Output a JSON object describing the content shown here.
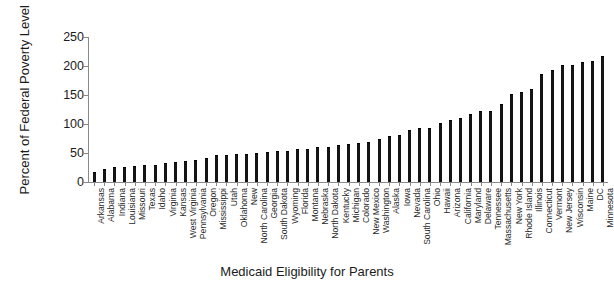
{
  "chart_data": {
    "type": "bar",
    "title": "",
    "xlabel": "Medicaid Eligibility for Parents",
    "ylabel": "Percent of Federal Poverty Level",
    "ylim": [
      0,
      250
    ],
    "yticks": [
      0,
      50,
      100,
      150,
      200,
      250
    ],
    "grid": false,
    "legend": null,
    "bar_color": "#141414",
    "axis_color": "#8a8a8a",
    "categories": [
      "Arkansas",
      "Alabama",
      "Indiana",
      "Louisiana",
      "Missouri",
      "Texas",
      "Idaho",
      "Virginia",
      "Kansas",
      "West Virginia",
      "Pennsylvania",
      "Oregon",
      "Mississippi",
      "Utah",
      "Oklahoma",
      "New",
      "North Carolina",
      "Georgia",
      "South Dakota",
      "Wyoming",
      "Florida",
      "Montana",
      "Nebraska",
      "North Dakota",
      "Kentucky",
      "Michigan",
      "Colorado",
      "New Mexico",
      "Washington",
      "Alaska",
      "Iowa",
      "Nevada",
      "South Carolina",
      "Ohio",
      "Hawaii",
      "Arizona",
      "California",
      "Maryland",
      "Delaware",
      "Tennessee",
      "Massachusetts",
      "New York",
      "Rhode Island",
      "Illinois",
      "Connecticut",
      "Vermont",
      "New Jersey",
      "Wisconsin",
      "Maine",
      "DC",
      "Minnesota"
    ],
    "values": [
      16,
      21,
      24,
      25,
      26,
      27,
      27,
      31,
      32,
      35,
      36,
      39,
      44,
      44,
      46,
      47,
      49,
      50,
      52,
      52,
      56,
      56,
      58,
      59,
      62,
      64,
      66,
      67,
      72,
      78,
      80,
      88,
      91,
      91,
      100,
      106,
      108,
      116,
      120,
      121,
      133,
      150,
      154,
      158,
      185,
      191,
      200,
      200,
      205,
      207,
      215
    ]
  }
}
